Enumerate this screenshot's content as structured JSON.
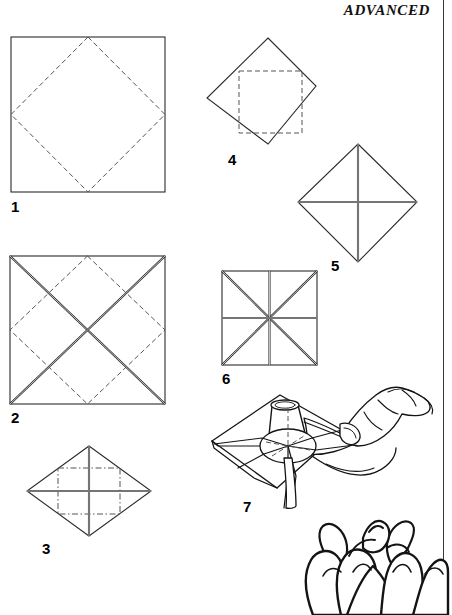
{
  "page": {
    "header": "ADVANCED",
    "width": 452,
    "height": 615,
    "background": "#ffffff",
    "ink_color": "#2b2b2b",
    "crease_color": "#555555"
  },
  "steps": [
    {
      "number": "1",
      "caption": "",
      "figure": "square-with-dashed-diamond",
      "label_x": 11,
      "label_y": 199
    },
    {
      "number": "2",
      "caption": "",
      "figure": "square-with-diagonals-and-dashed-diamond",
      "label_x": 11,
      "label_y": 410
    },
    {
      "number": "3",
      "caption": "",
      "figure": "diamond-with-cross-and-dashed-square",
      "label_x": 42,
      "label_y": 541
    },
    {
      "number": "4",
      "caption": "",
      "figure": "diamond-with-dashed-square",
      "label_x": 228,
      "label_y": 152
    },
    {
      "number": "5",
      "caption": "",
      "figure": "diamond-with-cross",
      "label_x": 331,
      "label_y": 258
    },
    {
      "number": "6",
      "caption": "",
      "figure": "square-with-eight-rays",
      "label_x": 222,
      "label_y": 371
    },
    {
      "number": "7",
      "caption": "",
      "figure": "hands-forming-cone-on-square",
      "label_x": 243,
      "label_y": 499
    }
  ],
  "illustration": {
    "name": "lotus-flower",
    "description": "line drawing of an open lotus blossom"
  }
}
